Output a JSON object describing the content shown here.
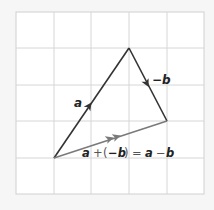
{
  "diagram": {
    "grid": {
      "cols": 5,
      "rows": 5,
      "x_lines": [
        16,
        54,
        91,
        129,
        167,
        204
      ],
      "y_lines": [
        12,
        48,
        85,
        121,
        158,
        194
      ],
      "line_color": "#d6d6d6",
      "fill": "#ffffff"
    },
    "points": {
      "origin": {
        "x": 54,
        "y": 158
      },
      "tip_a": {
        "x": 129,
        "y": 48
      },
      "tip_b": {
        "x": 167,
        "y": 121
      }
    },
    "vectors": [
      {
        "name": "a",
        "from": "origin",
        "to": "tip_a",
        "color": "#333333",
        "label": "a"
      },
      {
        "name": "neg-b",
        "from": "tip_a",
        "to": "tip_b",
        "color": "#333333",
        "label": "−b"
      },
      {
        "name": "a-minus-b",
        "from": "origin",
        "to": "tip_b",
        "color": "#7a7a7a",
        "label": "a + (−b) = a − b"
      }
    ],
    "labels": {
      "a": "a",
      "neg_b": "−b",
      "result_a1": "a",
      "result_plus": "+",
      "result_paren_open": "(",
      "result_neg_b": "−b",
      "result_paren_close": ")",
      "result_eq": "=",
      "result_a2": "a",
      "result_minus": "−",
      "result_b": "b"
    }
  }
}
